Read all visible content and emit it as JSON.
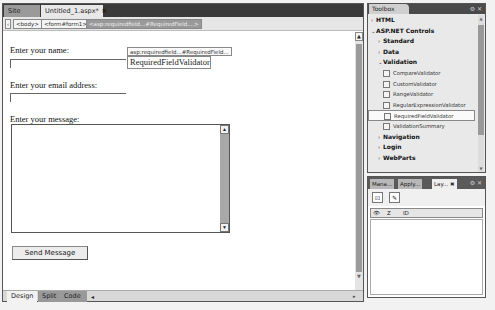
{
  "document": {
    "tabs": [
      {
        "label": "Site View",
        "active": false
      },
      {
        "label": "Untitled_1.aspx*",
        "active": true,
        "close": "✖"
      }
    ],
    "tag_selector": {
      "nav_arrow": "‹",
      "tags": [
        "<body>",
        "<form#form1>",
        "<asp:requiredfield...#RequiredField....>"
      ]
    },
    "form": {
      "name_label": "Enter your name:",
      "email_label": "Enter your email address:",
      "message_label": "Enter your message:",
      "validator_tag": "asp:requiredfield...#RequiredField...",
      "validator_text": "RequiredFieldValidator",
      "send_button": "Send Message"
    },
    "view_tabs": [
      {
        "label": "Design",
        "active": true
      },
      {
        "label": "Split",
        "active": false
      },
      {
        "label": "Code",
        "active": false
      }
    ]
  },
  "toolbox": {
    "title": "Toolbox",
    "items": [
      {
        "type": "cat",
        "level": 1,
        "expanded": false,
        "label": "HTML"
      },
      {
        "type": "cat",
        "level": 1,
        "expanded": true,
        "label": "ASP.NET Controls"
      },
      {
        "type": "cat",
        "level": 2,
        "expanded": false,
        "label": "Standard"
      },
      {
        "type": "cat",
        "level": 2,
        "expanded": false,
        "label": "Data"
      },
      {
        "type": "cat",
        "level": 2,
        "expanded": true,
        "label": "Validation"
      },
      {
        "type": "tool",
        "label": "CompareValidator"
      },
      {
        "type": "tool",
        "label": "CustomValidator"
      },
      {
        "type": "tool",
        "label": "RangeValidator"
      },
      {
        "type": "tool",
        "label": "RegularExpressionValidator"
      },
      {
        "type": "tool",
        "label": "RequiredFieldValidator",
        "selected": true
      },
      {
        "type": "tool",
        "label": "ValidationSummary"
      },
      {
        "type": "cat",
        "level": 2,
        "expanded": false,
        "label": "Navigation"
      },
      {
        "type": "cat",
        "level": 2,
        "expanded": false,
        "label": "Login"
      },
      {
        "type": "cat",
        "level": 2,
        "expanded": false,
        "label": "WebParts"
      }
    ]
  },
  "layers_panel": {
    "tabs": [
      {
        "label": "Mana...",
        "active": false
      },
      {
        "label": "Apply...",
        "active": false
      },
      {
        "label": "Lay...",
        "active": true,
        "close": "✖"
      }
    ],
    "columns": {
      "visibility": "👁",
      "z": "Z",
      "id": "ID"
    }
  }
}
